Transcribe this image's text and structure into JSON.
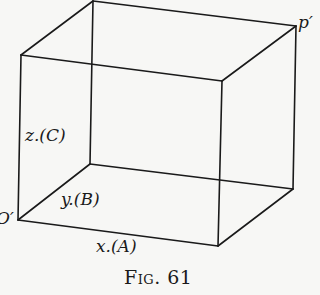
{
  "figure": {
    "type": "rectangular parallelepiped (perspective sketch)",
    "stroke_color": "#1a1a1a",
    "background": "#f7f7f5",
    "vertices": {
      "origin_front_bottom_left": [
        18,
        220
      ],
      "back_bottom_left": [
        90,
        164
      ],
      "front_bottom_right": [
        218,
        246
      ],
      "back_bottom_right": [
        293,
        189
      ],
      "front_top_left": [
        21,
        55
      ],
      "back_top_left": [
        93,
        1
      ],
      "front_top_right": [
        222,
        81
      ],
      "back_top_right": [
        296,
        26
      ]
    },
    "labels": {
      "origin": "O′",
      "corner_p": "p′",
      "z_axis": "z.(C)",
      "y_axis": "y.(B)",
      "x_axis": "x.(A)"
    },
    "caption": "Fig. 61"
  }
}
